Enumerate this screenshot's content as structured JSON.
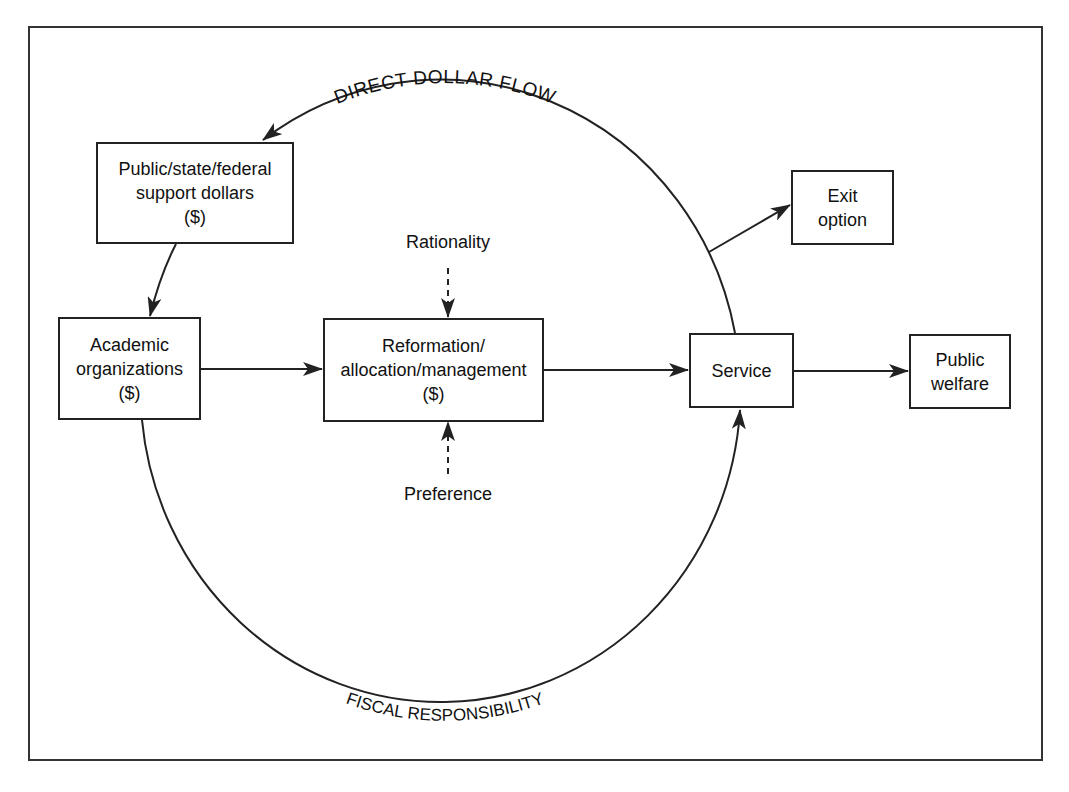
{
  "diagram": {
    "arc_labels": {
      "top": "DIRECT DOLLAR FLOW",
      "bottom": "FISCAL RESPONSIBILITY"
    },
    "nodes": {
      "support": {
        "lines": [
          "Public/state/federal",
          "support dollars",
          "($)"
        ]
      },
      "academic": {
        "lines": [
          "Academic",
          "organizations",
          "($)"
        ]
      },
      "reformation": {
        "lines": [
          "Reformation/",
          "allocation/management",
          "($)"
        ]
      },
      "service": {
        "lines": [
          "Service"
        ]
      },
      "welfare": {
        "lines": [
          "Public",
          "welfare"
        ]
      },
      "exit": {
        "lines": [
          "Exit",
          "option"
        ]
      }
    },
    "influences": {
      "rationality": "Rationality",
      "preference": "Preference"
    },
    "edges": [
      {
        "from": "service",
        "to": "support",
        "style": "curved-solid",
        "label": "DIRECT DOLLAR FLOW"
      },
      {
        "from": "support",
        "to": "academic",
        "style": "solid"
      },
      {
        "from": "academic",
        "to": "reformation",
        "style": "solid"
      },
      {
        "from": "reformation",
        "to": "service",
        "style": "solid"
      },
      {
        "from": "service",
        "to": "welfare",
        "style": "solid"
      },
      {
        "from": "direct-dollar-flow-arc",
        "to": "exit",
        "style": "solid"
      },
      {
        "from": "academic",
        "to": "service",
        "style": "curved-solid",
        "label": "FISCAL RESPONSIBILITY"
      },
      {
        "from": "rationality",
        "to": "reformation",
        "style": "dashed"
      },
      {
        "from": "preference",
        "to": "reformation",
        "style": "dashed"
      }
    ],
    "colors": {
      "line": "#222222",
      "background": "#ffffff"
    }
  }
}
